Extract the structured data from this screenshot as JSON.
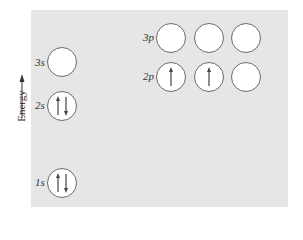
{
  "diagram": {
    "axis_label": "Energy",
    "colors": {
      "panel": "#e6e6e6",
      "orbital_stroke": "#6a6a6a",
      "orbital_fill": "#ffffff",
      "arrow": "#444444"
    },
    "levels": [
      {
        "label": "1s",
        "orbitals": [
          {
            "electrons": [
              "up",
              "down"
            ]
          }
        ]
      },
      {
        "label": "2s",
        "orbitals": [
          {
            "electrons": [
              "up",
              "down"
            ]
          }
        ]
      },
      {
        "label": "2p",
        "orbitals": [
          {
            "electrons": [
              "up"
            ]
          },
          {
            "electrons": [
              "up"
            ]
          },
          {
            "electrons": []
          }
        ]
      },
      {
        "label": "3s",
        "orbitals": [
          {
            "electrons": []
          }
        ]
      },
      {
        "label": "3p",
        "orbitals": [
          {
            "electrons": []
          },
          {
            "electrons": []
          },
          {
            "electrons": []
          }
        ]
      }
    ]
  }
}
